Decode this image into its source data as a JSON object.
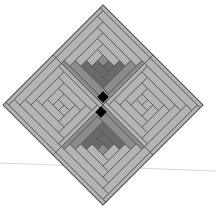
{
  "figure": {
    "center": [
      103,
      105
    ],
    "half_diagonal": 100,
    "colors": {
      "background": "#ffffff",
      "light": "#b4b4b4",
      "mid": "#8c8c8c",
      "dark": "#6a6a6a",
      "outline": "#505050",
      "center": "#000000",
      "guide_line": "#d8d8d8"
    },
    "blocks": [
      {
        "position": "top",
        "shade": "light"
      },
      {
        "position": "right",
        "shade": "dark-inner"
      },
      {
        "position": "bottom",
        "shade": "light"
      },
      {
        "position": "left",
        "shade": "dark-inner"
      }
    ],
    "guide_line": {
      "x1": 0,
      "y1": 163,
      "x2": 216,
      "y2": 171
    }
  }
}
